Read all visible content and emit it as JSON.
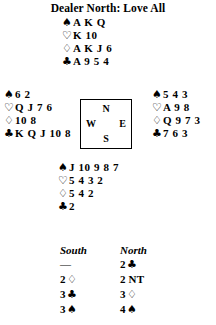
{
  "header": {
    "title": "Dealer North: Love All"
  },
  "suit_symbols": {
    "spade": "♠",
    "heart": "♡",
    "diamond": "♢",
    "club": "♣"
  },
  "compass": {
    "north": "N",
    "south": "S",
    "east": "E",
    "west": "W"
  },
  "hands": {
    "north": {
      "label": "North",
      "spades": "A K Q",
      "hearts": "K 10",
      "diamonds": "A K J 6",
      "clubs": "A 9 5 4"
    },
    "west": {
      "label": "West",
      "spades": "6 2",
      "hearts": "Q J 7 6",
      "diamonds": "10 8",
      "clubs": "K Q J 10 8"
    },
    "east": {
      "label": "East",
      "spades": "5 4 3",
      "hearts": "A 9 8",
      "diamonds": "Q 9 7 3",
      "clubs": "7 6 3"
    },
    "south": {
      "label": "South",
      "spades": "J 10 9 8 7",
      "hearts": "5 4 3 2",
      "diamonds": "5 4 2",
      "clubs": "2"
    }
  },
  "auction": {
    "columns": {
      "south": "South",
      "north": "North"
    },
    "rows": [
      {
        "south_level": "—",
        "south_suit": "",
        "south_nt": "",
        "north_level": "2",
        "north_suit": "♣",
        "north_nt": ""
      },
      {
        "south_level": "2",
        "south_suit": "♢",
        "south_nt": "",
        "north_level": "2",
        "north_suit": "",
        "north_nt": "NT"
      },
      {
        "south_level": "3",
        "south_suit": "♣",
        "south_nt": "",
        "north_level": "3",
        "north_suit": "♢",
        "north_nt": ""
      },
      {
        "south_level": "3",
        "south_suit": "♠",
        "south_nt": "",
        "north_level": "4",
        "north_suit": "♠",
        "north_nt": ""
      }
    ]
  }
}
